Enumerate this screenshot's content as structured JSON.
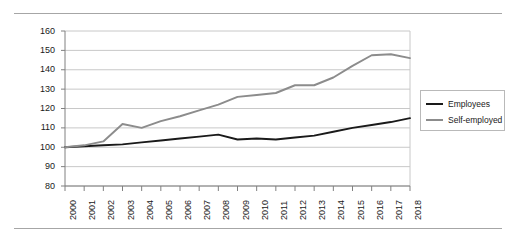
{
  "chart_data": {
    "type": "line",
    "title": "",
    "subtitle": "",
    "xlabel": "",
    "ylabel": "",
    "x": [
      2000,
      2001,
      2002,
      2003,
      2004,
      2005,
      2006,
      2007,
      2008,
      2009,
      2010,
      2011,
      2012,
      2013,
      2014,
      2015,
      2016,
      2017,
      2018
    ],
    "categories": [
      "2000",
      "2001",
      "2002",
      "2003",
      "2004",
      "2005",
      "2006",
      "2007",
      "2008",
      "2009",
      "2010",
      "2011",
      "2012",
      "2013",
      "2014",
      "2015",
      "2016",
      "2017",
      "2018"
    ],
    "series": [
      {
        "name": "Employees",
        "color": "#1a1a1a",
        "values": [
          100,
          100.5,
          101,
          101.5,
          102.5,
          103.5,
          104.5,
          105.5,
          106.5,
          104,
          104.5,
          104,
          105,
          106,
          108,
          110,
          111.5,
          113,
          115
        ]
      },
      {
        "name": "Self-employed",
        "color": "#8c8c8c",
        "values": [
          100,
          101,
          103,
          112,
          110,
          113.5,
          116,
          119,
          122,
          126,
          127,
          128,
          132,
          132,
          136,
          142,
          147.5,
          148,
          146
        ]
      }
    ],
    "ylim": [
      80,
      160
    ],
    "ytick_values": [
      80,
      90,
      100,
      110,
      120,
      130,
      140,
      150,
      160
    ],
    "ytick_labels": [
      "80",
      "90",
      "100",
      "110",
      "120",
      "130",
      "140",
      "150",
      "160"
    ],
    "grid": true,
    "legend_position": "right",
    "legend_entries": [
      "Employees",
      "Self-employed"
    ]
  },
  "legend": {
    "items": [
      {
        "label": "Employees",
        "color": "#1a1a1a"
      },
      {
        "label": "Self-employed",
        "color": "#8c8c8c"
      }
    ]
  },
  "axes": {
    "y_labels": [
      "160",
      "150",
      "140",
      "130",
      "120",
      "110",
      "100",
      "90",
      "80"
    ],
    "x_labels": [
      "2000",
      "2001",
      "2002",
      "2003",
      "2004",
      "2005",
      "2006",
      "2007",
      "2008",
      "2009",
      "2010",
      "2011",
      "2012",
      "2013",
      "2014",
      "2015",
      "2016",
      "2017",
      "2018"
    ]
  },
  "colors": {
    "employees_line": "#1a1a1a",
    "self_employed_line": "#8c8c8c",
    "gridline": "#c8c8c8",
    "axis": "#808080",
    "rule": "#a6a6a6"
  }
}
